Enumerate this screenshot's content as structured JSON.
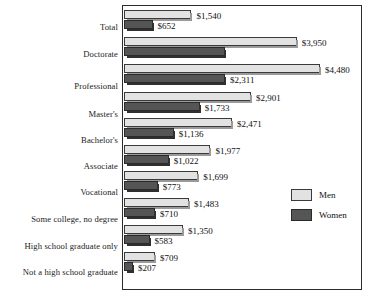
{
  "chart_data": {
    "type": "bar",
    "orientation": "horizontal",
    "title": "",
    "subtitle": "",
    "xlabel": "",
    "ylabel": "",
    "grid": false,
    "legend_position": "right",
    "xlim": [
      0,
      4480
    ],
    "categories": [
      "Total",
      "Doctorate",
      "Professional",
      "Master's",
      "Bachelor's",
      "Associate",
      "Vocational",
      "Some college, no degree",
      "High school graduate only",
      "Not a high school graduate"
    ],
    "series": [
      {
        "name": "Men",
        "color": "#e2e2e2",
        "values": [
          1540,
          3950,
          4480,
          2901,
          2471,
          1977,
          1699,
          1483,
          1350,
          709
        ],
        "labels": [
          "$1,540",
          "$3,950",
          "$4,480",
          "$2,901",
          "$2,471",
          "$1,977",
          "$1,699",
          "$1,483",
          "$1,350",
          "$709"
        ]
      },
      {
        "name": "Women",
        "color": "#555555",
        "values": [
          652,
          2311,
          2311,
          1733,
          1136,
          1022,
          773,
          710,
          583,
          207
        ],
        "labels": [
          "$652",
          "",
          "$2,311",
          "$1,733",
          "$1,136",
          "$1,022",
          "$773",
          "$710",
          "$583",
          "$207"
        ]
      }
    ]
  },
  "legend": {
    "entries": [
      {
        "label": "Men",
        "swatch": "men"
      },
      {
        "label": "Women",
        "swatch": "women"
      }
    ]
  }
}
